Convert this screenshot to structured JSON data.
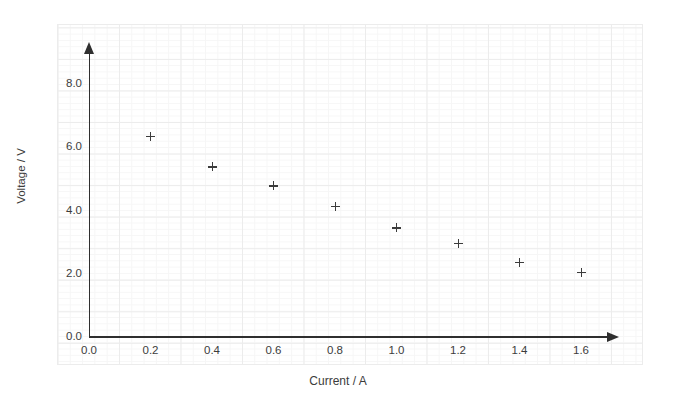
{
  "chart_data": {
    "type": "scatter",
    "title": "",
    "xlabel": "Current / A",
    "ylabel": "Voltage / V",
    "xlim": [
      0.0,
      1.7
    ],
    "ylim": [
      0.0,
      8.0
    ],
    "xticks": [
      "0.0",
      "0.2",
      "0.4",
      "0.6",
      "0.8",
      "1.0",
      "1.2",
      "1.4",
      "1.6"
    ],
    "xtick_values": [
      0.0,
      0.2,
      0.4,
      0.6,
      0.8,
      1.0,
      1.2,
      1.4,
      1.6
    ],
    "yticks": [
      "0.0",
      "2.0",
      "4.0",
      "6.0",
      "8.0"
    ],
    "ytick_values": [
      0.0,
      2.0,
      4.0,
      6.0,
      8.0
    ],
    "grid": true,
    "legend": null,
    "marker": "plus",
    "x": [
      0.2,
      0.4,
      0.6,
      0.8,
      1.0,
      1.2,
      1.4,
      1.6
    ],
    "values": [
      6.35,
      5.38,
      4.78,
      4.13,
      3.45,
      2.95,
      2.37,
      2.05
    ],
    "points": [
      {
        "x": 0.2,
        "y": 6.35
      },
      {
        "x": 0.4,
        "y": 5.38
      },
      {
        "x": 0.6,
        "y": 4.78
      },
      {
        "x": 0.8,
        "y": 4.13
      },
      {
        "x": 1.0,
        "y": 3.45
      },
      {
        "x": 1.2,
        "y": 2.95
      },
      {
        "x": 1.4,
        "y": 2.37
      },
      {
        "x": 1.6,
        "y": 2.05
      }
    ],
    "colors": {
      "marker": "#3c3c3c",
      "axis": "#2f2f2f",
      "grid_major": "#ececec",
      "grid_minor": "#f6f6f6",
      "background": "#ffffff",
      "text": "#3c3c3c"
    }
  }
}
